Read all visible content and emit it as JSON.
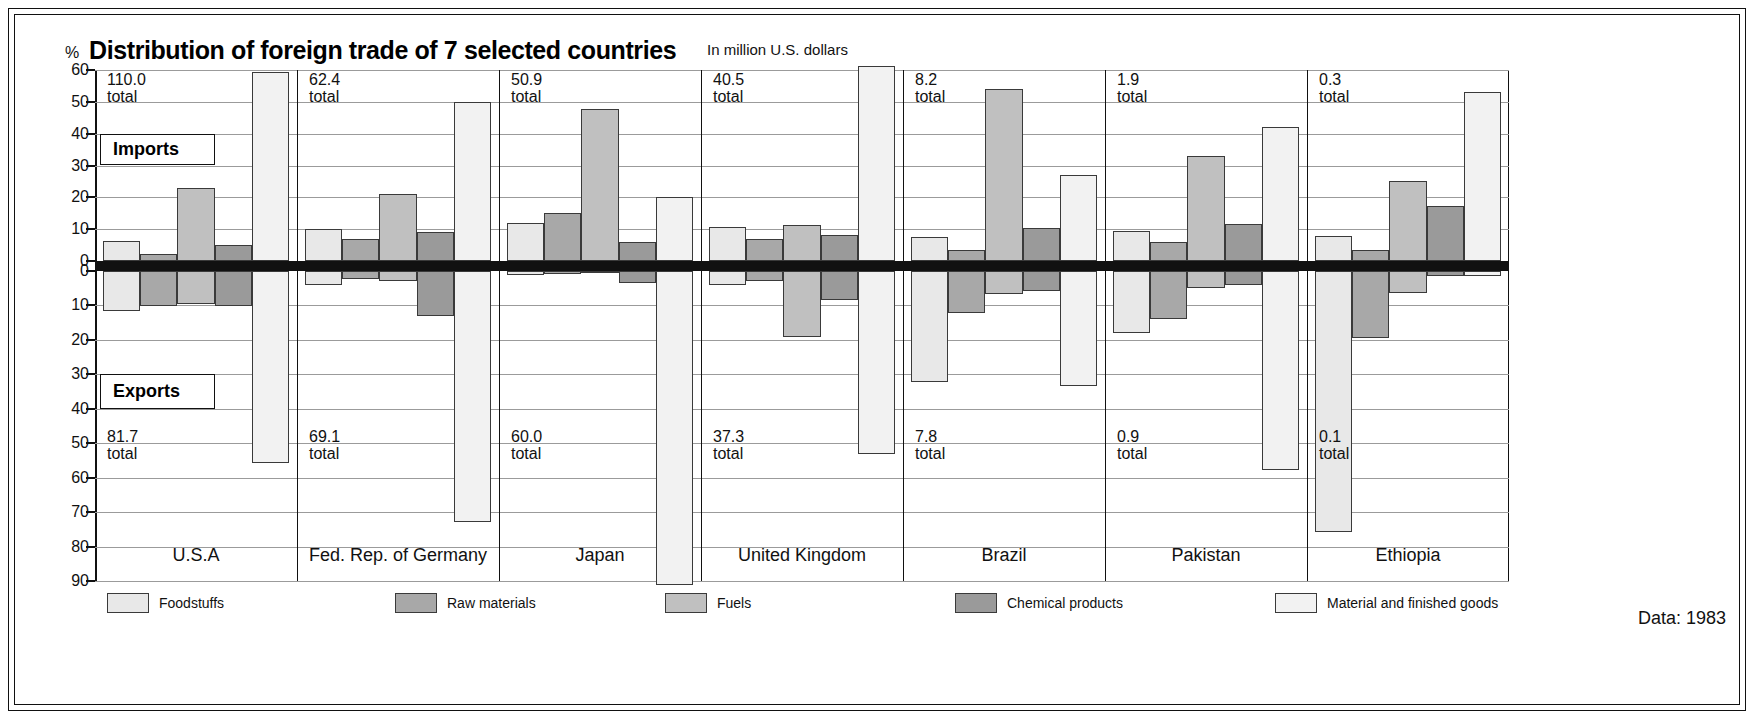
{
  "header": {
    "percent_symbol": "%",
    "title": "Distribution of foreign trade of 7 selected countries",
    "subtitle": "In million U.S. dollars"
  },
  "badges": {
    "imports": "Imports",
    "exports": "Exports"
  },
  "footer": {
    "data_note": "Data: 1983"
  },
  "axis": {
    "upper_ticks": [
      "60",
      "50",
      "40",
      "30",
      "20",
      "10",
      "0"
    ],
    "lower_ticks": [
      "0",
      "10",
      "20",
      "30",
      "40",
      "50",
      "60",
      "70",
      "80",
      "90"
    ]
  },
  "legend": [
    {
      "label": "Foodstuffs",
      "color": "#e8e8e8"
    },
    {
      "label": "Raw materials",
      "color": "#a8a8a8"
    },
    {
      "label": "Fuels",
      "color": "#c0c0c0"
    },
    {
      "label": "Chemical products",
      "color": "#9a9a9a"
    },
    {
      "label": "Material and finished goods",
      "color": "#f2f2f2"
    }
  ],
  "chart_data": {
    "type": "bar",
    "title": "Distribution of foreign trade of 7 selected countries",
    "subtitle": "In million U.S. dollars",
    "ylabel": "%",
    "upper_label": "Imports",
    "lower_label": "Exports",
    "ylim_upper": [
      0,
      60
    ],
    "ylim_lower": [
      0,
      90
    ],
    "grid": true,
    "legend_position": "bottom",
    "categories": [
      "Foodstuffs",
      "Raw materials",
      "Fuels",
      "Chemical products",
      "Material and finished goods"
    ],
    "countries": [
      {
        "name": "U.S.A",
        "imports_total": "110.0",
        "exports_total": "81.7",
        "total_suffix": "total",
        "imports": [
          6.2,
          2.3,
          22.8,
          5.0,
          59.3
        ],
        "exports": [
          11.5,
          10.2,
          9.5,
          10.3,
          55.6
        ]
      },
      {
        "name": "Fed. Rep. of Germany",
        "imports_total": "62.4",
        "exports_total": "69.1",
        "total_suffix": "total",
        "imports": [
          10.0,
          7.0,
          21.0,
          9.0,
          49.8
        ],
        "exports": [
          4.2,
          2.3,
          3.0,
          13.0,
          72.8
        ]
      },
      {
        "name": "Japan",
        "imports_total": "50.9",
        "exports_total": "60.0",
        "total_suffix": "total",
        "imports": [
          12.0,
          15.1,
          47.6,
          6.0,
          20.1
        ],
        "exports": [
          1.2,
          1.0,
          0.6,
          3.4,
          93.0
        ]
      },
      {
        "name": "United Kingdom",
        "imports_total": "40.5",
        "exports_total": "37.3",
        "total_suffix": "total",
        "imports": [
          10.6,
          7.0,
          11.2,
          8.2,
          61.4
        ],
        "exports": [
          4.0,
          2.8,
          19.2,
          8.5,
          53.2
        ]
      },
      {
        "name": "Brazil",
        "imports_total": "8.2",
        "exports_total": "7.8",
        "total_suffix": "total",
        "imports": [
          7.4,
          3.6,
          54.0,
          10.4,
          27.0
        ],
        "exports": [
          32.2,
          12.3,
          6.8,
          5.8,
          33.5
        ]
      },
      {
        "name": "Pakistan",
        "imports_total": "1.9",
        "exports_total": "0.9",
        "total_suffix": "total",
        "imports": [
          9.4,
          6.0,
          33.0,
          11.5,
          42.0
        ],
        "exports": [
          18.0,
          14.0,
          5.0,
          4.0,
          57.8
        ]
      },
      {
        "name": "Ethiopia",
        "imports_total": "0.3",
        "exports_total": "0.1",
        "total_suffix": "total",
        "imports": [
          8.0,
          3.5,
          25.2,
          17.4,
          53.0
        ],
        "exports": [
          75.8,
          19.5,
          6.5,
          1.5,
          1.5
        ]
      }
    ]
  }
}
